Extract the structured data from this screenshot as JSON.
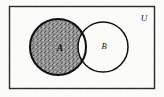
{
  "figure": {
    "kind": "venn-diagram",
    "universe": {
      "label": "U",
      "label_position": "top-right-inside",
      "rect": {
        "x": 9,
        "y": 6,
        "width": 146,
        "height": 83
      },
      "stroke_color": "#2b2b2b",
      "fill_color": "#fbfbfa"
    },
    "sets": [
      {
        "id": "A",
        "label": "A",
        "cx": 58,
        "cy": 47,
        "r": 28,
        "stroke_color": "#111111",
        "fill_color": "#ffffff",
        "label_x": 60,
        "label_y": 50
      },
      {
        "id": "B",
        "label": "B",
        "cx": 103,
        "cy": 47,
        "r": 25,
        "stroke_color": "#111111",
        "fill_color": "#ffffff",
        "label_x": 104,
        "label_y": 48
      }
    ],
    "shaded_region": {
      "name": "A-minus-B",
      "description": "A only (A without B)",
      "fill_color": "#8d8d8d",
      "texture": "stipple-grain"
    },
    "unshaded_regions": [
      "A-intersect-B",
      "B-only",
      "outside-both"
    ]
  }
}
